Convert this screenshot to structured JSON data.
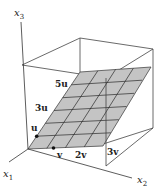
{
  "figure": {
    "colors": {
      "plane_fill": "#c4c4c4",
      "line": "#333333",
      "grid": "#2a2a2a",
      "background": "#ffffff"
    },
    "axes": {
      "x1": {
        "label": "x",
        "sub": "1"
      },
      "x2": {
        "label": "x",
        "sub": "2"
      },
      "x3": {
        "label": "x",
        "sub": "3"
      }
    },
    "vector_labels": {
      "u": "u",
      "u3": "3u",
      "u5": "5u",
      "v": "v",
      "v2": "2v",
      "v3": "3v"
    }
  }
}
